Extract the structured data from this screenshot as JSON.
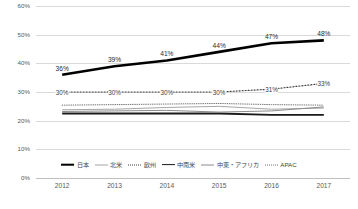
{
  "chart_data": {
    "type": "line",
    "title": "",
    "xlabel": "",
    "ylabel": "",
    "x": [
      "2012",
      "2013",
      "2014",
      "2015",
      "2016",
      "2017"
    ],
    "ylim": [
      0,
      60
    ],
    "ytick_labels": [
      "0%",
      "10%",
      "20%",
      "30%",
      "40%",
      "50%",
      "60%"
    ],
    "ytick_values": [
      0,
      10,
      20,
      30,
      40,
      50,
      60
    ],
    "grid": true,
    "legend_position": "bottom",
    "series": [
      {
        "name": "日本",
        "values": [
          36,
          39,
          41,
          44,
          47,
          48
        ],
        "color": "#000000",
        "width": 2.6,
        "dash": "none",
        "labels": [
          "36%",
          "39%",
          "41%",
          "44%",
          "47%",
          "48%"
        ]
      },
      {
        "name": "北米",
        "values": [
          23.8,
          24.0,
          24.6,
          25.0,
          24.0,
          24.4
        ],
        "color": "#a6a6a6",
        "width": 1.0,
        "dash": "none",
        "labels": []
      },
      {
        "name": "欧州",
        "values": [
          30,
          30,
          30,
          30,
          31,
          33
        ],
        "color": "#404040",
        "width": 1.2,
        "dash": "1,2",
        "labels": [
          "30%",
          "30%",
          "30%",
          "30%",
          "31%",
          "33%"
        ]
      },
      {
        "name": "中南米",
        "values": [
          22.5,
          22.5,
          22.5,
          22.5,
          22.0,
          22.0
        ],
        "color": "#1a1a1a",
        "width": 1.8,
        "dash": "none",
        "labels": []
      },
      {
        "name": "中東・アフリカ",
        "values": [
          23.2,
          23.4,
          23.6,
          23.0,
          23.4,
          24.8
        ],
        "color": "#8c8c8c",
        "width": 1.0,
        "dash": "none",
        "labels": []
      },
      {
        "name": "APAC",
        "values": [
          25.4,
          25.6,
          25.8,
          26.0,
          25.6,
          25.4
        ],
        "color": "#737373",
        "width": 1.0,
        "dash": "0.6,1.6",
        "labels": []
      }
    ]
  }
}
